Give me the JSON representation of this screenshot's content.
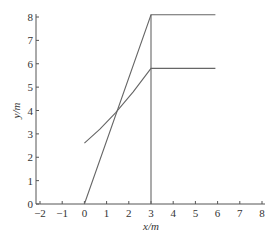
{
  "chart_data": {
    "type": "line",
    "title": "",
    "xlabel": "x/m",
    "ylabel": "y/m",
    "xlim": [
      -2,
      8
    ],
    "ylim": [
      0,
      8
    ],
    "xticks": [
      "-2",
      "-1",
      "0",
      "1",
      "2",
      "3",
      "4",
      "5",
      "6",
      "7",
      "8"
    ],
    "yticks": [
      "0",
      "1",
      "2",
      "3",
      "4",
      "5",
      "6",
      "7",
      "8"
    ],
    "grid": false,
    "legend": null,
    "series": [
      {
        "name": "line-1",
        "x": [
          0,
          3,
          3,
          5.9
        ],
        "y": [
          0,
          8.1,
          8.1,
          8.1
        ]
      },
      {
        "name": "curve-2",
        "x": [
          0,
          0.7,
          1.4,
          2.2,
          3,
          5.9
        ],
        "y": [
          2.6,
          3.2,
          3.9,
          4.8,
          5.8,
          5.8
        ]
      },
      {
        "name": "vertical-line",
        "x": [
          3,
          3
        ],
        "y": [
          0,
          8.1
        ]
      }
    ],
    "intersection_point": {
      "x": 1.4,
      "y": 3.9
    }
  },
  "labels": {
    "xlabel": "x/m",
    "ylabel": "y/m"
  }
}
